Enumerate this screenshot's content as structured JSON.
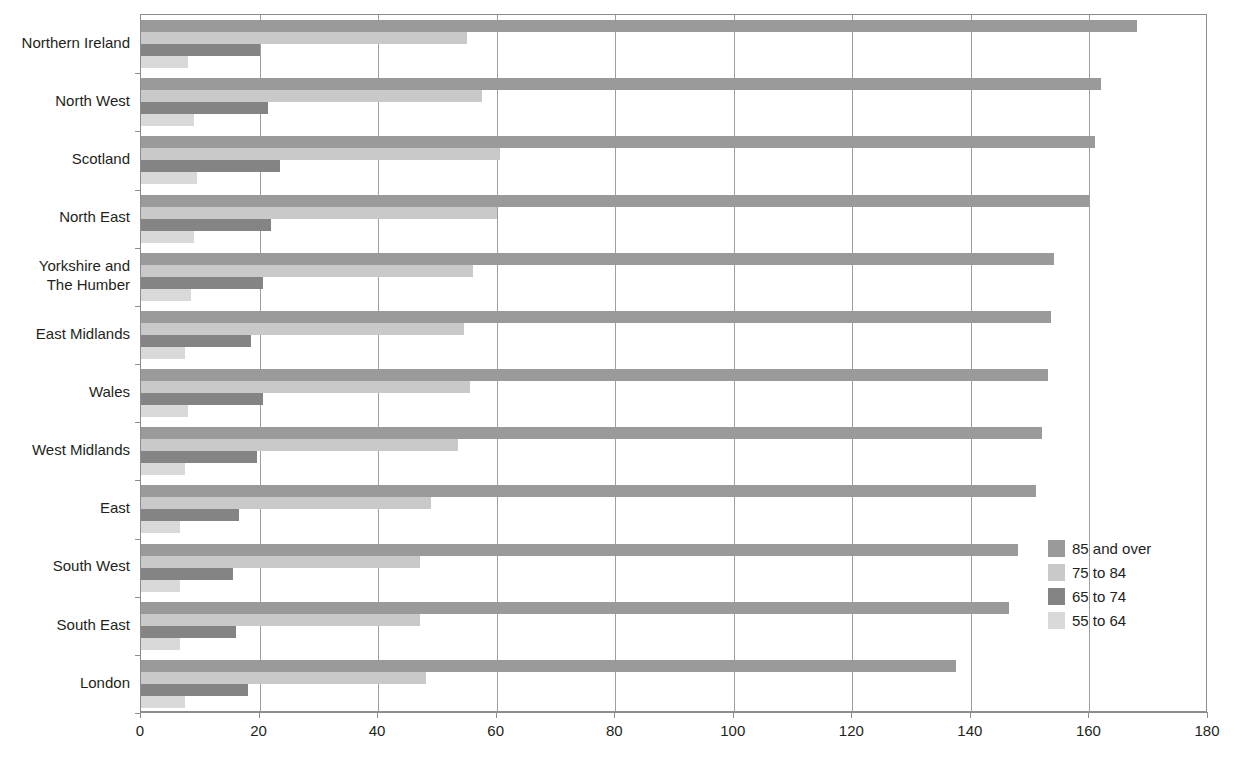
{
  "chart_data": {
    "type": "bar",
    "orientation": "horizontal",
    "title": "",
    "subtitle": "",
    "xlabel": "",
    "ylabel": "",
    "xlim": [
      0,
      180
    ],
    "ylim": null,
    "grid": true,
    "grid_axis": "x",
    "legend_position": "right-inside",
    "xticks": [
      0,
      20,
      40,
      60,
      80,
      100,
      120,
      140,
      160,
      180
    ],
    "xtick_labels": [
      "0",
      "20",
      "40",
      "60",
      "80",
      "100",
      "120",
      "140",
      "160",
      "180"
    ],
    "categories": [
      "Northern Ireland",
      "North West",
      "Scotland",
      "North East",
      "Yorkshire and\nThe Humber",
      "East Midlands",
      "Wales",
      "West Midlands",
      "East",
      "South West",
      "South East",
      "London"
    ],
    "series": [
      {
        "name": "85 and over",
        "color": "#9a9a9a",
        "values": [
          168,
          162,
          161,
          160,
          154,
          153.5,
          153,
          152,
          151,
          148,
          146.5,
          137.5
        ]
      },
      {
        "name": "75 to 84",
        "color": "#c9c9c9",
        "values": [
          55,
          57.5,
          60.5,
          60,
          56,
          54.5,
          55.5,
          53.5,
          49,
          47,
          47,
          48
        ]
      },
      {
        "name": "65 to 74",
        "color": "#848484",
        "values": [
          20,
          21.5,
          23.5,
          22,
          20.5,
          18.5,
          20.5,
          19.5,
          16.5,
          15.5,
          16,
          18
        ]
      },
      {
        "name": "55 to 64",
        "color": "#d9d9d9",
        "values": [
          8,
          9,
          9.5,
          9,
          8.5,
          7.5,
          8,
          7.5,
          6.5,
          6.5,
          6.5,
          7.5
        ]
      }
    ]
  },
  "legend": {
    "items": [
      {
        "label": "85 and over",
        "color": "#9a9a9a"
      },
      {
        "label": "75 to 84",
        "color": "#c9c9c9"
      },
      {
        "label": "65 to 74",
        "color": "#848484"
      },
      {
        "label": "55 to 64",
        "color": "#d9d9d9"
      }
    ]
  }
}
